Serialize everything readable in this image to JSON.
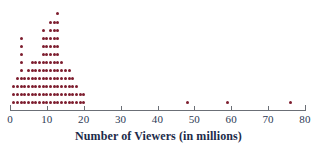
{
  "chart_data": {
    "type": "scatter",
    "plot_style": "dot-plot",
    "title": "",
    "xlabel": "Number of Viewers (in millions)",
    "ylabel": "",
    "xlim": [
      0,
      81
    ],
    "xticks": [
      0,
      10,
      20,
      30,
      40,
      50,
      60,
      70,
      80
    ],
    "xticklabels": [
      "0",
      "10",
      "20",
      "30",
      "40",
      "50",
      "60",
      "70",
      "80"
    ],
    "grid": false,
    "legend": null,
    "dot_color": "#7d1d2e",
    "axis_color": "#6b6f76",
    "label_color": "#2b3a55",
    "x": [
      1,
      2,
      3,
      4,
      5,
      6,
      7,
      8,
      9,
      10,
      11,
      12,
      13,
      14,
      15,
      16,
      17,
      18,
      19,
      20,
      48,
      59,
      76
    ],
    "counts": [
      3,
      4,
      9,
      4,
      5,
      6,
      6,
      6,
      10,
      9,
      11,
      11,
      12,
      6,
      5,
      5,
      4,
      3,
      2,
      2,
      1,
      1,
      1
    ],
    "total_points": 136,
    "outliers": [
      48,
      59,
      76
    ]
  },
  "axis": {
    "title": "Number of Viewers (in millions)"
  }
}
